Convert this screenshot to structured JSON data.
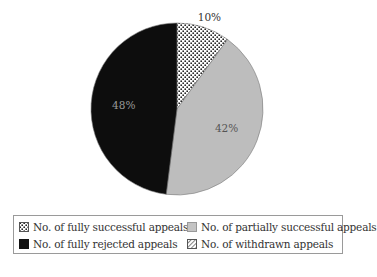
{
  "chart_data": {
    "type": "pie",
    "title": "",
    "categories": [
      "No. of fully successful appeals",
      "No. of partially successful appeals",
      "No. of fully rejected appeals",
      "No. of withdrawn appeals"
    ],
    "values": [
      10,
      42,
      48,
      0
    ],
    "labels": [
      "10%",
      "42%",
      "48%",
      ""
    ],
    "colors": [
      "#ffffff",
      "#bdbdbd",
      "#0d0d0d",
      "#ffffff"
    ],
    "patterns": [
      "dots",
      "solid",
      "solid",
      "diagonal-hatch"
    ],
    "start_angle_deg": 0,
    "direction": "clockwise",
    "legend_position": "bottom"
  },
  "legend": {
    "items": [
      {
        "label": "No. of fully successful appeals",
        "pattern": "dots"
      },
      {
        "label": "No. of partially successful appeals",
        "pattern": "solid-gray"
      },
      {
        "label": "No. of fully rejected appeals",
        "pattern": "solid-black"
      },
      {
        "label": "No. of withdrawn appeals",
        "pattern": "diagonal-hatch"
      }
    ]
  }
}
